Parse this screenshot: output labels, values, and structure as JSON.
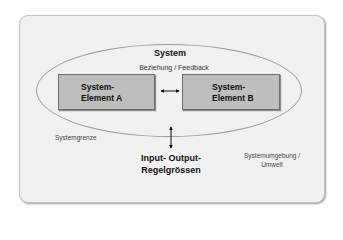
{
  "diagram": {
    "system_title": "System",
    "relation_label": "Beziehung / Feedback",
    "element_a": {
      "line1": "System-",
      "line2": "Element A"
    },
    "element_b": {
      "line1": "System-",
      "line2": "Element B"
    },
    "boundary_label": "Systemgrenze",
    "io_label": {
      "line1": "Input- Output-",
      "line2": "Regelgrössen"
    },
    "environment_label": {
      "line1": "Systemumgebung /",
      "line2": "Umwelt"
    },
    "colors": {
      "panel_background": "#f1f1f1",
      "element_fill": "#bebebe",
      "element_border": "#6f6f6f",
      "ellipse_stroke": "#9a9a9a",
      "arrow": "#111111"
    }
  }
}
